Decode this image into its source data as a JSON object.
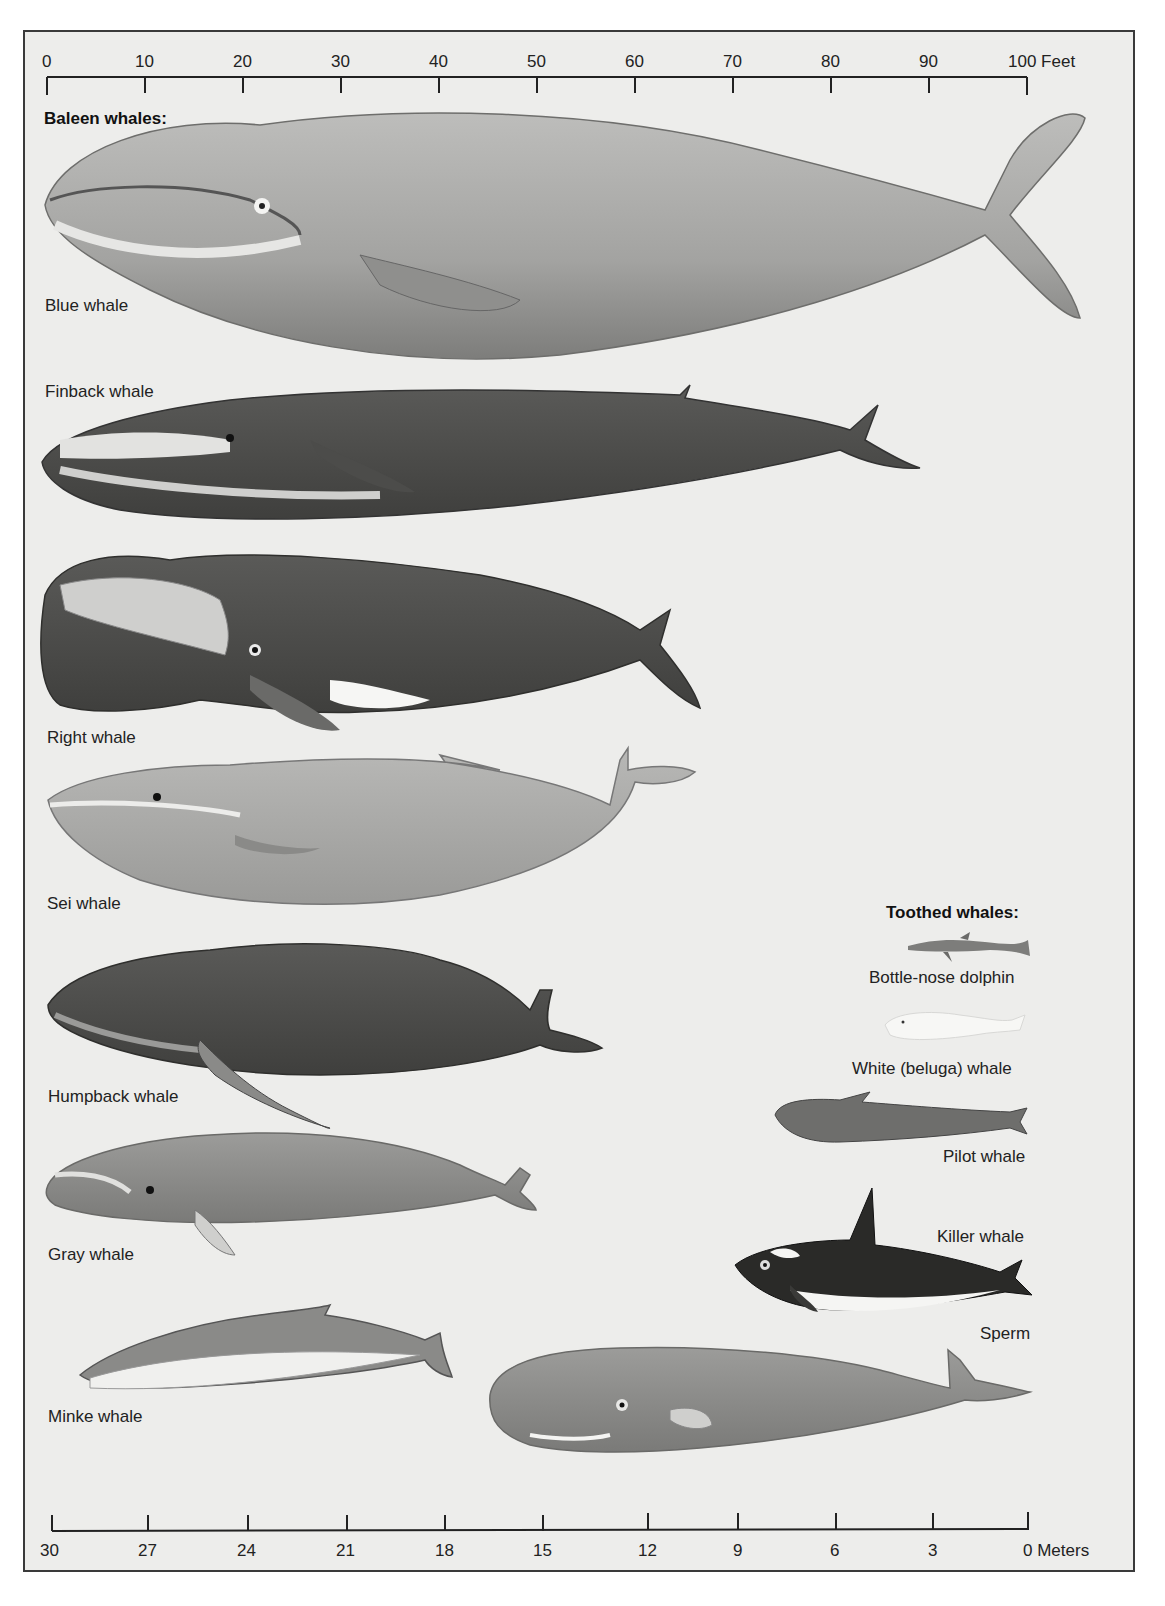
{
  "feet_scale": {
    "unit_label": "Feet",
    "ticks": [
      "0",
      "10",
      "20",
      "30",
      "40",
      "50",
      "60",
      "70",
      "80",
      "90",
      "100"
    ],
    "last_label": "100 Feet"
  },
  "meters_scale": {
    "unit_label": "Meters",
    "ticks": [
      "30",
      "27",
      "24",
      "21",
      "18",
      "15",
      "12",
      "9",
      "6",
      "3",
      "0"
    ],
    "last_label": "0 Meters"
  },
  "sections": {
    "baleen_title": "Baleen whales:",
    "toothed_title": "Toothed whales:"
  },
  "baleen_whales": [
    {
      "name": "Blue whale"
    },
    {
      "name": "Finback whale"
    },
    {
      "name": "Right whale"
    },
    {
      "name": "Sei whale"
    },
    {
      "name": "Humpback whale"
    },
    {
      "name": "Gray whale"
    },
    {
      "name": "Minke whale"
    }
  ],
  "toothed_whales": [
    {
      "name": "Bottle-nose dolphin"
    },
    {
      "name": "White (beluga) whale"
    },
    {
      "name": "Pilot whale"
    },
    {
      "name": "Killer whale"
    },
    {
      "name": "Sperm"
    }
  ],
  "colors": {
    "background": "#ededeb",
    "frame": "#3a3a3a",
    "text": "#1a1a1a"
  }
}
